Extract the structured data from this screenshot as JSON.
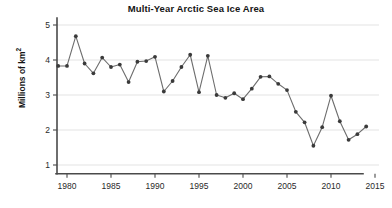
{
  "chart": {
    "title": "Multi-Year Arctic Sea Ice Area",
    "y_axis_label_text": "Millions of km",
    "y_axis_label_sup": "2",
    "background_color": "#ffffff",
    "line_color": "#6d6d6d",
    "marker_color": "#3a3a3a",
    "grid_color": "#dcdcdc",
    "axis_color": "#4a4a4a"
  },
  "chart_data": {
    "type": "line",
    "title": "Multi-Year Arctic Sea Ice Area",
    "xlabel": "",
    "ylabel": "Millions of km2",
    "xlim": [
      1978,
      2015.5
    ],
    "ylim": [
      0.75,
      5.2
    ],
    "xticks": [
      1980,
      1985,
      1990,
      1995,
      2000,
      2005,
      2010,
      2015
    ],
    "xtick_labels": [
      "1980",
      "1985",
      "1990",
      "1995",
      "2000",
      "2005",
      "2010",
      "2015"
    ],
    "yticks": [
      1,
      2,
      3,
      4,
      5
    ],
    "ytick_labels": [
      "1",
      "2",
      "3",
      "4",
      "5"
    ],
    "grid": "horizontal",
    "legend": "none",
    "markers": "filled-circle",
    "x": [
      1979,
      1980,
      1981,
      1982,
      1983,
      1984,
      1985,
      1986,
      1987,
      1988,
      1989,
      1990,
      1991,
      1992,
      1993,
      1994,
      1995,
      1996,
      1997,
      1998,
      1999,
      2000,
      2001,
      2002,
      2003,
      2004,
      2005,
      2006,
      2007,
      2008,
      2009,
      2010,
      2011,
      2012,
      2013,
      2014
    ],
    "values": [
      3.83,
      3.83,
      4.68,
      3.9,
      3.62,
      4.07,
      3.8,
      3.87,
      3.37,
      3.95,
      3.97,
      4.09,
      3.1,
      3.4,
      3.8,
      4.15,
      3.08,
      4.12,
      3.0,
      2.92,
      3.05,
      2.88,
      3.18,
      3.52,
      3.53,
      3.32,
      3.14,
      2.52,
      2.22,
      1.55,
      2.08,
      2.98,
      2.25,
      1.72,
      1.88,
      2.1
    ],
    "series": [
      {
        "name": "Multi-year Arctic sea ice area",
        "values": [
          3.83,
          3.83,
          4.68,
          3.9,
          3.62,
          4.07,
          3.8,
          3.87,
          3.37,
          3.95,
          3.97,
          4.09,
          3.1,
          3.4,
          3.8,
          4.15,
          3.08,
          4.12,
          3.0,
          2.92,
          3.05,
          2.88,
          3.18,
          3.52,
          3.53,
          3.32,
          3.14,
          2.52,
          2.22,
          1.55,
          2.08,
          2.98,
          2.25,
          1.72,
          1.88,
          2.1
        ]
      }
    ]
  }
}
